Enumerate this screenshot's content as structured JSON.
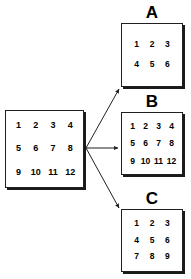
{
  "diagram": {
    "title_visible": false,
    "background_color": "#ffffff",
    "stroke_color": "#231f20",
    "shadow_color": "#1a1a1a",
    "text_color": "#000000",
    "source": {
      "name": "source-matrix",
      "rows": 3,
      "cols": 4,
      "cells": [
        "1",
        "2",
        "3",
        "4",
        "5",
        "6",
        "7",
        "8",
        "9",
        "10",
        "11",
        "12"
      ]
    },
    "outputs": [
      {
        "id": "a",
        "label": "A",
        "rows": 2,
        "cols": 3,
        "cells": [
          "1",
          "2",
          "3",
          "4",
          "5",
          "6"
        ]
      },
      {
        "id": "b",
        "label": "B",
        "rows": 3,
        "cols": 4,
        "cells": [
          "1",
          "2",
          "3",
          "4",
          "5",
          "6",
          "7",
          "8",
          "9",
          "10",
          "11",
          "12"
        ]
      },
      {
        "id": "c",
        "label": "C",
        "rows": 3,
        "cols": 3,
        "cells": [
          "1",
          "2",
          "3",
          "4",
          "5",
          "6",
          "7",
          "8",
          "9"
        ]
      }
    ],
    "arrows": [
      {
        "id": "arrow-to-a",
        "from": [
          86,
          148
        ],
        "to": [
          120,
          88
        ]
      },
      {
        "id": "arrow-to-b",
        "from": [
          86,
          148
        ],
        "to": [
          119,
          148
        ]
      },
      {
        "id": "arrow-to-c",
        "from": [
          86,
          148
        ],
        "to": [
          120,
          209
        ]
      }
    ]
  }
}
